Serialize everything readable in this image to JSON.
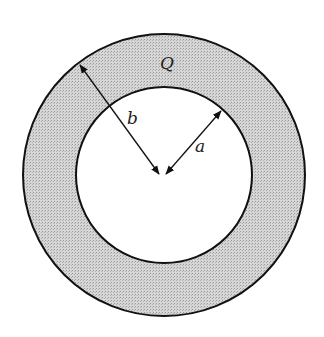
{
  "diagram": {
    "labels": {
      "charge": "Q",
      "outer_radius": "b",
      "inner_radius": "a"
    },
    "colors": {
      "ring_fill": "#cfcfcf",
      "stroke": "#111111",
      "background": "#ffffff"
    },
    "geometry": {
      "center": [
        162,
        176
      ],
      "outer_r": 141,
      "inner_r": 88
    }
  }
}
